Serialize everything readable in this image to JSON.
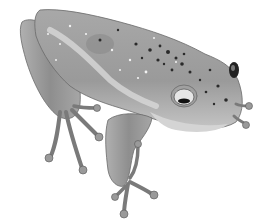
{
  "image": {
    "subject": "tree frog illustration",
    "style": "grayscale pencil drawing",
    "background": "#ffffff",
    "colors": {
      "body": "#9a9a9a",
      "body_light": "#c8c8c8",
      "belly": "#d4d4d4",
      "outline": "#6a6a6a",
      "spots_dark": "#2a2a2a",
      "spots_light": "#f2f2f2",
      "eye_ring": "#e6e6e6",
      "pupil": "#111111"
    }
  }
}
